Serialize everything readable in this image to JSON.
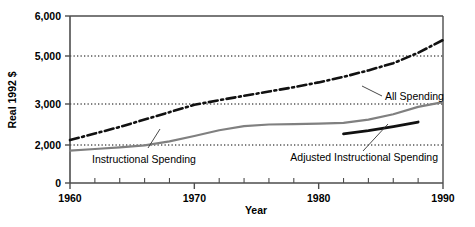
{
  "chart_data": {
    "type": "line",
    "title": "",
    "xlabel": "Year",
    "ylabel": "Real 1992 $",
    "xlim": [
      1960,
      1990
    ],
    "ylim": [
      0,
      6000
    ],
    "grid": true,
    "grid_values": [
      2000,
      3000,
      5000
    ],
    "legend_position": "inline-annotations",
    "x_tick_labels": [
      "1960",
      "1970",
      "1980",
      "1990"
    ],
    "x_tick_values": [
      1960,
      1970,
      1980,
      1990
    ],
    "x_minor_tick_values": [
      1962,
      1964,
      1966,
      1968,
      1972,
      1974,
      1976,
      1978,
      1982,
      1984,
      1986,
      1988
    ],
    "y_tick_labels": [
      "0",
      "2,000",
      "3,000",
      "5,000",
      "6,000"
    ],
    "y_tick_values": [
      0,
      2000,
      3000,
      5000,
      6000
    ],
    "series": [
      {
        "name": "All Spending",
        "style": "dash-dot",
        "color": "#111111",
        "width": 2.6,
        "label_text": "All Spending",
        "x": [
          1960,
          1962,
          1964,
          1966,
          1968,
          1970,
          1972,
          1974,
          1976,
          1978,
          1980,
          1982,
          1984,
          1986,
          1988,
          1990
        ],
        "values": [
          2120,
          2280,
          2440,
          2620,
          2800,
          2980,
          3160,
          3340,
          3520,
          3700,
          3900,
          4130,
          4400,
          4700,
          5080,
          5400
        ]
      },
      {
        "name": "Instructional Spending",
        "style": "solid",
        "color": "#808080",
        "width": 2.2,
        "label_text": "Instructional Spending",
        "x": [
          1960,
          1962,
          1964,
          1966,
          1968,
          1970,
          1972,
          1974,
          1976,
          1978,
          1980,
          1982,
          1984,
          1986,
          1988,
          1990
        ],
        "values": [
          1700,
          1790,
          1880,
          1980,
          2090,
          2220,
          2360,
          2460,
          2500,
          2510,
          2520,
          2540,
          2620,
          2750,
          2930,
          3080
        ]
      },
      {
        "name": "Adjusted Instructional Spending",
        "style": "solid",
        "color": "#111111",
        "width": 2.8,
        "label_text": "Adjusted Instructional Spending",
        "x": [
          1982,
          1984,
          1986,
          1988
        ],
        "values": [
          2270,
          2350,
          2450,
          2560
        ]
      }
    ]
  },
  "annotations": {
    "all_spending": "All Spending",
    "instructional_spending": "Instructional Spending",
    "adjusted_instructional_spending": "Adjusted Instructional Spending"
  },
  "axis": {
    "x_title": "Year",
    "y_title": "Real 1992 $"
  },
  "colors": {
    "axis": "#4d4d4d",
    "grid": "#000000",
    "all_spending": "#111111",
    "instructional_spending": "#808080",
    "adjusted": "#111111",
    "background": "#ffffff"
  }
}
